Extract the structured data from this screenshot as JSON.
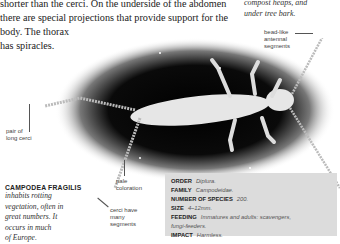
{
  "body_text": {
    "lines": [
      "shorter than the cerci. On the underside of the abdomen",
      "there are special projections that provide support for the",
      "body. The thorax",
      "has spiracles."
    ]
  },
  "side_note": {
    "lines": [
      "compost heaps, and",
      "under tree bark."
    ]
  },
  "labels": {
    "antennal": [
      "bead-like",
      "antennal",
      "segments"
    ],
    "cerci_pair": [
      "pair of",
      "long cerci"
    ],
    "pale": [
      "pale",
      "coloration"
    ],
    "cerci_segments": [
      "cerci have",
      "many",
      "segments"
    ]
  },
  "species": {
    "title": "CAMPODEA FRAGILIS",
    "desc_lines": [
      "inhabits rotting",
      "vegetation, often in",
      "great numbers. It",
      "occurs in much",
      "of Europe."
    ]
  },
  "facts": [
    {
      "key": "ORDER",
      "value": "Diplura."
    },
    {
      "key": "FAMILY",
      "value": "Campodeidae."
    },
    {
      "key": "NUMBER OF SPECIES",
      "value": "200."
    },
    {
      "key": "SIZE",
      "value": "4–12mm."
    },
    {
      "key": "FEEDING",
      "value": "Immatures and adults: scavengers,"
    },
    {
      "key": "",
      "value": "fungi-feeders."
    },
    {
      "key": "IMPACT",
      "value": "Harmless."
    }
  ]
}
